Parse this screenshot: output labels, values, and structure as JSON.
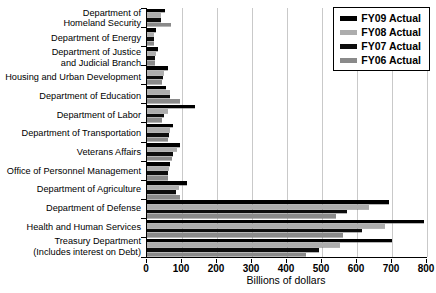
{
  "chart_data": {
    "type": "bar",
    "orientation": "horizontal",
    "title": "",
    "xlabel": "Billions of dollars",
    "xlim": [
      0,
      800
    ],
    "xticks": [
      0,
      100,
      200,
      300,
      400,
      500,
      600,
      700,
      800
    ],
    "grid": true,
    "gridline_color": "#c9c9c9",
    "legend_position": "top-right",
    "categories": [
      "Department of\nHomeland Security",
      "Department of Energy",
      "Department of Justice\nand Judicial Branch",
      "Housing and Urban Development",
      "Department of Education",
      "Department of Labor",
      "Department of Transportation",
      "Veterans Affairs",
      "Office of Personnel Management",
      "Department of Agriculture",
      "Department of Defense",
      "Health and Human Services",
      "Treasury Department\n(Includes interest on Debt)"
    ],
    "series": [
      {
        "name": "FY09 Actual",
        "color": "#000000",
        "values": [
          52,
          27,
          30,
          61,
          53,
          138,
          73,
          95,
          67,
          114,
          690,
          790,
          700
        ]
      },
      {
        "name": "FY08 Actual",
        "color": "#adadad",
        "values": [
          41,
          21,
          27,
          49,
          66,
          59,
          65,
          85,
          62,
          91,
          635,
          680,
          550
        ]
      },
      {
        "name": "FY07 Actual",
        "color": "#0d0d0d",
        "values": [
          39,
          20,
          24,
          46,
          66,
          48,
          62,
          73,
          59,
          84,
          570,
          615,
          490
        ]
      },
      {
        "name": "FY06 Actual",
        "color": "#8a8a8a",
        "values": [
          69,
          20,
          23,
          42,
          93,
          44,
          60,
          70,
          60,
          94,
          540,
          560,
          455
        ]
      }
    ]
  }
}
